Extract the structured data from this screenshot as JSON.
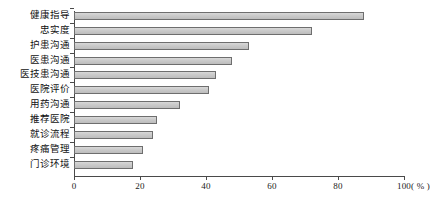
{
  "chart_data": {
    "type": "bar",
    "orientation": "horizontal",
    "title": "",
    "xlabel": "( % )",
    "ylabel": "",
    "xlim": [
      0,
      100
    ],
    "xticks": [
      0,
      20,
      40,
      60,
      80,
      100
    ],
    "xtick_labels": [
      "0",
      "20",
      "40",
      "60",
      "80",
      "100"
    ],
    "unit_label": "( % )",
    "grid": false,
    "legend": false,
    "bar_fill_color": "#c9c9c9",
    "bar_edge_color": "#6e6e6e",
    "axis_color": "#4a4a4a",
    "categories": [
      "健康指导",
      "忠实度",
      "护患沟通",
      "医患沟通",
      "医技患沟通",
      "医院评价",
      "用药沟通",
      "推荐医院",
      "就诊流程",
      "疼痛管理",
      "门诊环境"
    ],
    "values": [
      88,
      72,
      53,
      48,
      43,
      41,
      32,
      25,
      24,
      21,
      18
    ]
  }
}
